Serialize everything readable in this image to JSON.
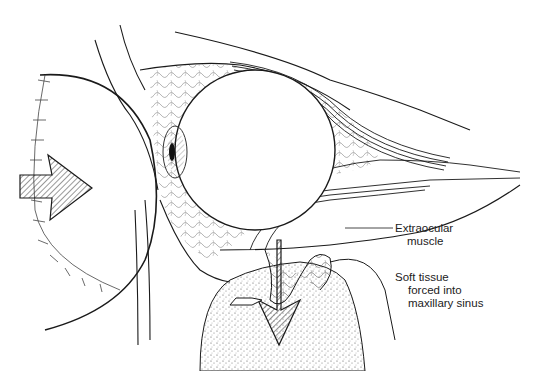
{
  "figure": {
    "labels": {
      "extraocular_line1": "Extraocular",
      "extraocular_line2": "muscle",
      "soft_tissue_line1": "Soft tissue",
      "soft_tissue_line2": "forced into",
      "soft_tissue_line3": "maxillary sinus"
    },
    "elements": [
      "impacting-object",
      "force-arrow",
      "eyeball",
      "iris",
      "extraocular-muscles",
      "orbital-fat",
      "orbital-floor",
      "maxillary-sinus",
      "herniation-arrow"
    ],
    "colors": {
      "ink": "#1a1a1a",
      "background": "#ffffff",
      "stipple": "#555555"
    }
  }
}
